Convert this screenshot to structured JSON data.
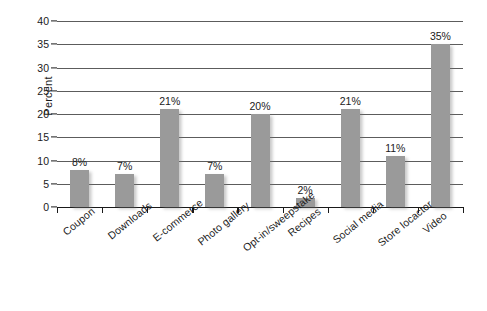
{
  "chart_data": {
    "type": "bar",
    "title": "",
    "subtitle": "",
    "xlabel": "",
    "ylabel": "Percent",
    "categories": [
      "Coupon",
      "Downloads",
      "E-commerce",
      "Photo gallery",
      "Opt-in/sweepstake",
      "Recipes",
      "Social media",
      "Store locactor",
      "Video"
    ],
    "values": [
      8,
      7,
      21,
      7,
      20,
      2,
      21,
      11,
      35
    ],
    "data_labels": [
      "8%",
      "7%",
      "21%",
      "7%",
      "20%",
      "2%",
      "21%",
      "11%",
      "35%"
    ],
    "ylim": [
      0,
      40
    ],
    "ytick_values": [
      0,
      5,
      10,
      15,
      20,
      25,
      30,
      35,
      40
    ],
    "ytick_labels": [
      "0",
      "5",
      "10",
      "15",
      "20",
      "25",
      "30",
      "35",
      "40"
    ],
    "grid": true,
    "grid_axis": "y",
    "legend": false,
    "legend_position": "none",
    "bar_color": "#9a9a9a",
    "axis_color": "#1a1a1a",
    "gridline_color": "#5c5c5c",
    "background_color": "#ffffff",
    "label_rotation_degrees": -39
  }
}
